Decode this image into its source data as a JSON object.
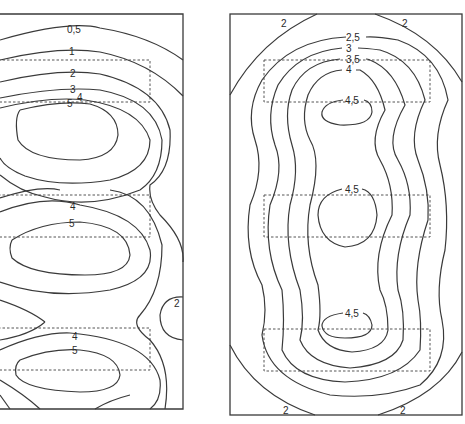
{
  "figure": {
    "panels": [
      {
        "id": "left",
        "contour_labels": [
          {
            "text": "0,5",
            "x": 76,
            "y": 30
          },
          {
            "text": "1",
            "x": 72,
            "y": 53
          },
          {
            "text": "2",
            "x": 73,
            "y": 75
          },
          {
            "text": "3",
            "x": 73,
            "y": 92
          },
          {
            "text": "4",
            "x": 80,
            "y": 101
          },
          {
            "text": "5",
            "x": 70,
            "y": 107
          },
          {
            "text": "4",
            "x": 73,
            "y": 209
          },
          {
            "text": "5",
            "x": 72,
            "y": 226
          },
          {
            "text": "4",
            "x": 75,
            "y": 339
          },
          {
            "text": "5",
            "x": 75,
            "y": 353
          },
          {
            "text": "2",
            "x": 177,
            "y": 306
          }
        ],
        "zones": 3
      },
      {
        "id": "right",
        "contour_labels": [
          {
            "text": "2",
            "x": 284,
            "y": 26
          },
          {
            "text": "2",
            "x": 405,
            "y": 26
          },
          {
            "text": "2,5",
            "x": 353,
            "y": 40
          },
          {
            "text": "3",
            "x": 348,
            "y": 51
          },
          {
            "text": "3,5",
            "x": 353,
            "y": 62
          },
          {
            "text": "4",
            "x": 348,
            "y": 72
          },
          {
            "text": "4,5",
            "x": 352,
            "y": 103
          },
          {
            "text": "4,5",
            "x": 352,
            "y": 192
          },
          {
            "text": "4,5",
            "x": 352,
            "y": 317
          },
          {
            "text": "2",
            "x": 285,
            "y": 416
          },
          {
            "text": "2",
            "x": 403,
            "y": 416
          }
        ],
        "zones": 3
      }
    ]
  }
}
